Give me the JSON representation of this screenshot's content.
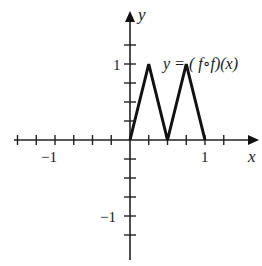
{
  "chart_data": {
    "type": "line",
    "title": "",
    "xlabel": "x",
    "ylabel": "y",
    "xlim": [
      -1.5,
      1.5
    ],
    "ylim": [
      -1.5,
      1.5
    ],
    "grid": false,
    "tick_step": 0.25,
    "x_tick_labels": [
      {
        "value": -1,
        "label": "−1"
      },
      {
        "value": 1,
        "label": "1"
      }
    ],
    "y_tick_labels": [
      {
        "value": 1,
        "label": "1"
      },
      {
        "value": -1,
        "label": "−1"
      }
    ],
    "series": [
      {
        "name": "y = (f∘f)(x)",
        "x": [
          0,
          0.25,
          0.5,
          0.75,
          1
        ],
        "y": [
          0,
          1,
          0,
          1,
          0
        ],
        "color": "#111111"
      }
    ],
    "annotations": [
      {
        "text": "y = ( f∘f)(x)",
        "x": 0.47,
        "y": 1.22
      }
    ]
  },
  "labels": {
    "x_axis": "x",
    "y_axis": "y",
    "x_neg1": "−1",
    "x_pos1": "1",
    "y_pos1": "1",
    "y_neg1": "−1",
    "curve_label": "y = ( f∘f)(x)"
  }
}
